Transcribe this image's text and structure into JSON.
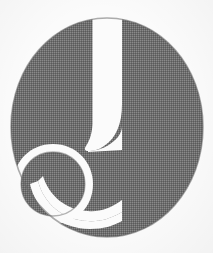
{
  "image": {
    "kind": "logo-mark",
    "subject": "stylized lowercase letter g",
    "alt_text": "Stylized lowercase letter g logo",
    "width": 213,
    "height": 253,
    "background_color": "#fbfbfb",
    "ink_color": "#6e6e6e",
    "ink_color_dark": "#5f5f5f",
    "texture": "dithered halftone print",
    "letter": "g"
  },
  "shapes": {
    "bowl": {
      "name": "upper-bowl",
      "center_x": 107,
      "center_y": 127,
      "radius_x": 96,
      "radius_y": 109,
      "fill": "#6e6e6e"
    },
    "notch": {
      "name": "white-vertical-notch",
      "top": 18,
      "left": 92,
      "right": 122,
      "bottom": 150,
      "fill": "#fbfbfb"
    },
    "dot": {
      "name": "lower-left-dot",
      "center_x": 53,
      "center_y": 184,
      "radius": 32,
      "fill": "#6e6e6e"
    },
    "bite": {
      "name": "bottom-white-bite",
      "center_x": 80,
      "center_y": 206,
      "fill": "#fbfbfb"
    },
    "stem": {
      "name": "right-stem-edge",
      "edge_x": 122,
      "top": 18,
      "bottom": 237
    }
  },
  "geometry": {
    "bowl_path": "M 107 18 C 160 18 203 66 203 127 C 203 188 160 237 107 237 C 54 237 11 188 11 127 C 11 66 54 18 107 18 Z",
    "notch_path": "M 93 18 L 122 18 L 122 143 C 113 152 101 152 93 143 C 89 139 90 132 93 124 Z",
    "hook_path": "M 122 104 C 122 128 110 146 92 150 C 100 150 110 147 118 140 C 122 136 122 130 122 126 Z",
    "dot_path": "M 53 152 C 71 152 85 166 85 184 C 85 202 71 216 53 216 C 35 216 21 202 21 184 C 21 166 35 152 53 152 Z",
    "bite_path": "M 44 203 C 56 221 76 230 99 229 C 112 228 122 224 122 224 L 122 237 C 96 237 70 228 52 212 Z"
  }
}
